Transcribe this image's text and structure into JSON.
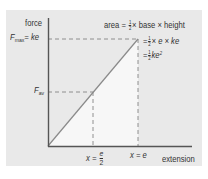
{
  "diagram": {
    "type": "force-extension graph",
    "colors": {
      "background": "#ffffff",
      "panel": "#e9e9e9",
      "shaded_area": "#f7f7f7",
      "axis": "#555555",
      "line": "#888888",
      "dashed": "#777777",
      "text": "#333333"
    },
    "y_axis": {
      "label": "force"
    },
    "x_axis": {
      "label": "extension"
    },
    "y_ticks": {
      "fmax": {
        "symbol": "F",
        "sub": "max",
        "eq": "= ke"
      },
      "fav": {
        "symbol": "F",
        "sub": "av"
      }
    },
    "x_ticks": {
      "half": {
        "lhs": "x =",
        "num": "e",
        "den": "2"
      },
      "full": {
        "text": "x = e"
      }
    },
    "annotation": {
      "line1_pre": "area =",
      "line1_num": "1",
      "line1_den": "2",
      "line1_post": "× base × height",
      "line2_pre": "=",
      "line2_num": "1",
      "line2_den": "2",
      "line2_post": "× e × ke",
      "line3_pre": "=",
      "line3_num": "1",
      "line3_den": "2",
      "line3_post": "ke",
      "line3_sup": "2"
    }
  }
}
